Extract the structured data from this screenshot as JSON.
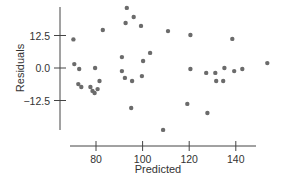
{
  "chart_data": {
    "type": "scatter",
    "title": "",
    "xlabel": "Predicted",
    "ylabel": "Residuals",
    "xlim": [
      67,
      155
    ],
    "ylim": [
      -24,
      25
    ],
    "grid": false,
    "legend": null,
    "x_ticks": [
      80,
      100,
      120,
      140
    ],
    "x_tick_labels": [
      "80",
      "100",
      "120",
      "140"
    ],
    "y_ticks": [
      12.5,
      0.0,
      -12.5
    ],
    "y_tick_labels": [
      "12.5",
      "0.0",
      "−12.5"
    ],
    "point_color": "#6b6b6b",
    "points": [
      {
        "x": 70.3,
        "y": 11.0
      },
      {
        "x": 82.9,
        "y": 14.6
      },
      {
        "x": 70.7,
        "y": 1.5
      },
      {
        "x": 72.8,
        "y": -0.4
      },
      {
        "x": 79.6,
        "y": 0.0
      },
      {
        "x": 72.4,
        "y": -6.2
      },
      {
        "x": 73.7,
        "y": -7.3
      },
      {
        "x": 77.6,
        "y": -7.3
      },
      {
        "x": 78.5,
        "y": -8.8
      },
      {
        "x": 79.4,
        "y": -9.6
      },
      {
        "x": 80.7,
        "y": -8.1
      },
      {
        "x": 81.5,
        "y": -5.0
      },
      {
        "x": 93.2,
        "y": 23.1
      },
      {
        "x": 96.2,
        "y": 19.6
      },
      {
        "x": 92.7,
        "y": 17.3
      },
      {
        "x": 99.3,
        "y": 16.2
      },
      {
        "x": 110.9,
        "y": 14.2
      },
      {
        "x": 91.1,
        "y": 4.2
      },
      {
        "x": 103.2,
        "y": 5.8
      },
      {
        "x": 100.2,
        "y": 2.7
      },
      {
        "x": 91.1,
        "y": -1.2
      },
      {
        "x": 92.4,
        "y": -3.8
      },
      {
        "x": 95.5,
        "y": -5.0
      },
      {
        "x": 99.7,
        "y": -3.1
      },
      {
        "x": 95.1,
        "y": -15.4
      },
      {
        "x": 108.8,
        "y": -23.8
      },
      {
        "x": 120.5,
        "y": 12.7
      },
      {
        "x": 120.5,
        "y": -0.4
      },
      {
        "x": 127.3,
        "y": -1.9
      },
      {
        "x": 131.2,
        "y": -1.9
      },
      {
        "x": 135.1,
        "y": 0.0
      },
      {
        "x": 134.6,
        "y": -5.0
      },
      {
        "x": 119.2,
        "y": -13.8
      },
      {
        "x": 127.8,
        "y": -17.3
      },
      {
        "x": 138.5,
        "y": 11.2
      },
      {
        "x": 139.3,
        "y": -1.2
      },
      {
        "x": 142.8,
        "y": -0.4
      },
      {
        "x": 153.5,
        "y": 1.9
      },
      {
        "x": 131.6,
        "y": -5.0
      }
    ]
  }
}
